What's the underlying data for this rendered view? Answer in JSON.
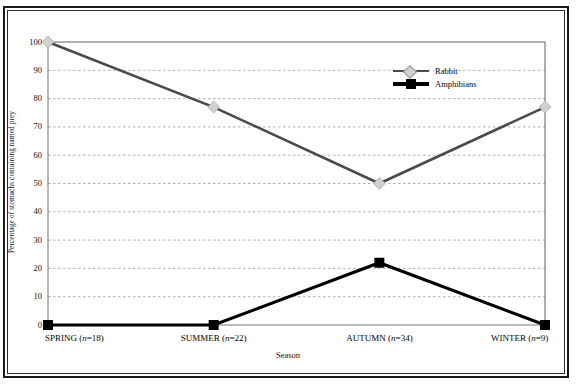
{
  "figure": {
    "clipped_caption_above": "Fig. Seasonal diet composition",
    "x_axis_title": "Season",
    "y_axis_title": "Percentage of stomachs containing named prey"
  },
  "legend": {
    "position": "inside-top-right",
    "entries": [
      {
        "label": "Rabbit",
        "marker": "diamond-marker-icon",
        "color": "#d0d0d0",
        "line_color": "#4a4a4a"
      },
      {
        "label": "Amphibians",
        "marker": "square-marker-icon",
        "color": "#000000",
        "line_color": "#000000"
      }
    ]
  },
  "chart_data": {
    "type": "line",
    "title": "",
    "subtitle": "",
    "xlabel": "Season",
    "ylabel": "Percentage of stomachs containing named prey",
    "categories": [
      "SPRING (n=18)",
      "SUMMER (n=22)",
      "AUTUMN (n=34)",
      "WINTER (n=9)"
    ],
    "category_names": [
      "SPRING",
      "SUMMER",
      "AUTUMN",
      "WINTER"
    ],
    "category_counts": [
      18,
      22,
      34,
      9
    ],
    "series": [
      {
        "name": "Rabbit",
        "values": [
          100,
          77,
          50,
          77
        ],
        "color": "#d0d0d0",
        "line_color": "#4a4a4a",
        "marker": "diamond"
      },
      {
        "name": "Amphibians",
        "values": [
          0,
          0,
          22,
          0
        ],
        "color": "#000000",
        "line_color": "#000000",
        "marker": "square"
      }
    ],
    "ylim": [
      0,
      100
    ],
    "yticks": [
      0,
      10,
      20,
      30,
      40,
      50,
      60,
      70,
      80,
      90,
      100
    ],
    "ytick_labels": [
      "0",
      "10",
      "20",
      "30",
      "40",
      "50",
      "60",
      "70",
      "80",
      "90",
      "100"
    ],
    "grid": true,
    "grid_axis": "y",
    "grid_style": "dashed",
    "legend_position": "upper right"
  }
}
